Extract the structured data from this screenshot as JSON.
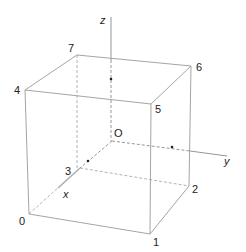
{
  "diagram": {
    "title": "",
    "type": "3d-cube-coordinate-axes",
    "colors": {
      "edge": "#9a9a9a",
      "axis": "#8a8a8a",
      "label": "#222222",
      "point": "#222222",
      "background": "#ffffff"
    },
    "origin_label": "O",
    "axes": [
      {
        "name": "x",
        "label": "x"
      },
      {
        "name": "y",
        "label": "y"
      },
      {
        "name": "z",
        "label": "z"
      }
    ],
    "vertices": [
      {
        "label": "0"
      },
      {
        "label": "1"
      },
      {
        "label": "2"
      },
      {
        "label": "3"
      },
      {
        "label": "4"
      },
      {
        "label": "5"
      },
      {
        "label": "6"
      },
      {
        "label": "7"
      }
    ],
    "visible_edges": [
      "4-5",
      "5-6",
      "6-7",
      "7-4",
      "4-0",
      "0-1",
      "1-2",
      "2-6",
      "1-5"
    ],
    "hidden_edges": [
      "0-3",
      "3-2",
      "3-7"
    ],
    "marked_points": [
      "on-z-axis",
      "on-y-axis",
      "on-x-axis"
    ]
  }
}
